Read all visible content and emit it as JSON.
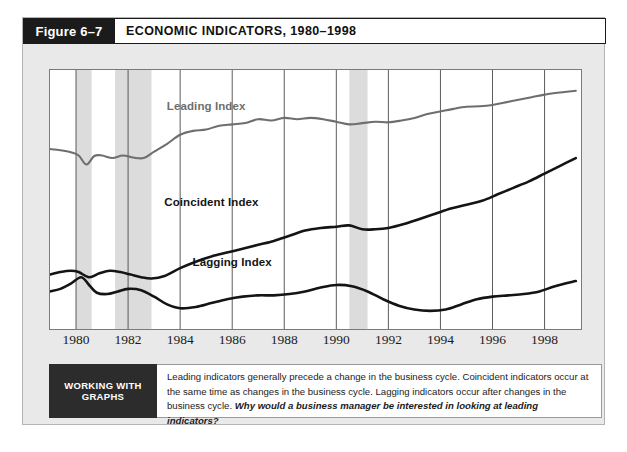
{
  "figure": {
    "tag_label": "Figure 6–7",
    "title": "ECONOMIC INDICATORS, 1980–1998"
  },
  "caption": {
    "tag": "WORKING WITH GRAPHS",
    "text": "Leading indicators generally precede a change in the business cycle. Coincident indicators occur at the same time as changes in the business cycle. Lagging indicators occur after changes in the business cycle. ",
    "question": "Why would a business manager be interested in looking at leading indicators?"
  },
  "colors": {
    "leading": "#6e6e6e",
    "coincident": "#141414",
    "lagging": "#141414",
    "recession_band": "#dcdcdc",
    "gridline": "#4a4a4a",
    "panel_border": "#7a7a7a",
    "figure_bg": "#e9e9e9",
    "header_tab": "#1b1b1b",
    "caption_tag_bg": "#2c2c2c"
  },
  "chart_data": {
    "type": "line",
    "title": "ECONOMIC INDICATORS, 1980–1998",
    "xlabel": "",
    "ylabel": "",
    "xlim": [
      1979.0,
      1999.4
    ],
    "ylim": [
      0,
      100
    ],
    "grid": "vertical-only",
    "legend": "inline-labels",
    "tick_years": [
      1980,
      1982,
      1984,
      1986,
      1988,
      1990,
      1992,
      1994,
      1996,
      1998
    ],
    "recession_bands": [
      {
        "start": 1980.0,
        "end": 1980.6,
        "label": "1980 recession"
      },
      {
        "start": 1981.5,
        "end": 1982.9,
        "label": "1981–82 recession"
      },
      {
        "start": 1990.5,
        "end": 1991.2,
        "label": "1990–91 recession"
      }
    ],
    "series": [
      {
        "name": "Leading Index",
        "color": "#6e6e6e",
        "label_x": 1985.0,
        "label_y": 86,
        "x": [
          1979.0,
          1979.4,
          1979.8,
          1980.1,
          1980.4,
          1980.7,
          1981.0,
          1981.4,
          1981.8,
          1982.2,
          1982.6,
          1983.0,
          1983.5,
          1984.0,
          1984.5,
          1985.0,
          1985.5,
          1986.0,
          1986.5,
          1987.0,
          1987.5,
          1988.0,
          1988.5,
          1989.0,
          1989.5,
          1990.0,
          1990.5,
          1991.0,
          1991.5,
          1992.0,
          1992.5,
          1993.0,
          1993.5,
          1994.0,
          1994.5,
          1995.0,
          1995.5,
          1996.0,
          1996.5,
          1997.0,
          1997.5,
          1998.0,
          1998.5,
          1999.2
        ],
        "values": [
          69.5,
          69.0,
          68.2,
          67.0,
          63.5,
          66.8,
          67.0,
          66.0,
          67.0,
          66.2,
          66.0,
          68.5,
          71.5,
          75.0,
          76.5,
          77.0,
          78.5,
          79.0,
          79.5,
          81.0,
          80.5,
          81.5,
          81.0,
          81.5,
          81.0,
          80.0,
          79.0,
          79.5,
          80.0,
          79.8,
          80.5,
          81.5,
          83.0,
          84.0,
          85.0,
          85.8,
          86.0,
          86.5,
          87.5,
          88.5,
          89.5,
          90.5,
          91.2,
          92.0
        ]
      },
      {
        "name": "Coincident Index",
        "color": "#141414",
        "label_x": 1985.2,
        "label_y": 49,
        "x": [
          1979.0,
          1979.4,
          1979.8,
          1980.1,
          1980.5,
          1980.9,
          1981.3,
          1981.7,
          1982.1,
          1982.5,
          1982.9,
          1983.4,
          1984.0,
          1984.6,
          1985.2,
          1985.8,
          1986.4,
          1987.0,
          1987.6,
          1988.2,
          1988.8,
          1989.4,
          1990.0,
          1990.5,
          1991.0,
          1991.5,
          1992.0,
          1992.6,
          1993.2,
          1993.8,
          1994.4,
          1995.0,
          1995.6,
          1996.2,
          1996.8,
          1997.4,
          1998.0,
          1998.6,
          1999.2
        ],
        "values": [
          21.0,
          22.0,
          22.5,
          22.0,
          20.0,
          21.5,
          22.5,
          22.0,
          21.0,
          20.0,
          19.5,
          20.5,
          23.5,
          26.0,
          28.0,
          29.5,
          31.0,
          32.5,
          34.0,
          36.0,
          38.0,
          39.0,
          39.5,
          40.0,
          38.5,
          38.5,
          39.0,
          40.5,
          42.5,
          44.5,
          46.5,
          48.0,
          49.5,
          52.0,
          54.5,
          57.0,
          60.0,
          63.0,
          66.0
        ]
      },
      {
        "name": "Lagging Index",
        "color": "#141414",
        "label_x": 1986.0,
        "label_y": 26,
        "x": [
          1979.0,
          1979.4,
          1979.8,
          1980.2,
          1980.5,
          1980.8,
          1981.2,
          1981.6,
          1982.0,
          1982.5,
          1983.0,
          1983.5,
          1984.0,
          1984.6,
          1985.2,
          1985.8,
          1986.4,
          1987.0,
          1987.6,
          1988.2,
          1988.8,
          1989.4,
          1990.0,
          1990.6,
          1991.2,
          1991.8,
          1992.4,
          1993.0,
          1993.6,
          1994.2,
          1994.8,
          1995.4,
          1996.0,
          1996.6,
          1997.2,
          1997.8,
          1998.4,
          1999.2
        ],
        "values": [
          14.5,
          15.5,
          17.5,
          20.0,
          17.0,
          14.0,
          13.5,
          14.5,
          15.5,
          15.0,
          12.5,
          9.5,
          8.0,
          8.5,
          10.0,
          11.5,
          12.5,
          13.0,
          13.0,
          13.5,
          14.5,
          16.0,
          17.0,
          16.5,
          14.5,
          11.5,
          9.0,
          7.5,
          7.0,
          7.5,
          9.5,
          11.5,
          12.5,
          13.0,
          13.5,
          14.5,
          16.5,
          18.5
        ]
      }
    ]
  }
}
